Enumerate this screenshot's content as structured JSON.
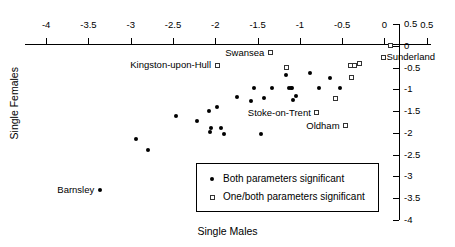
{
  "chart_data": {
    "type": "scatter",
    "title": "",
    "xlabel": "Single Males",
    "ylabel": "Single Females",
    "xlim": [
      -4.25,
      0.55
    ],
    "ylim": [
      -4.0,
      0.5
    ],
    "grid": false,
    "legend_position": "bottom-center",
    "xticks": [
      {
        "value": -4,
        "label": "-4"
      },
      {
        "value": -3.5,
        "label": "-3.5"
      },
      {
        "value": -3,
        "label": "-3"
      },
      {
        "value": -2.5,
        "label": "-2.5"
      },
      {
        "value": -2,
        "label": "-2"
      },
      {
        "value": -1.5,
        "label": "-1.5"
      },
      {
        "value": -1,
        "label": "-1"
      },
      {
        "value": -0.5,
        "label": "-0.5"
      },
      {
        "value": 0,
        "label": "0"
      },
      {
        "value": 0.5,
        "label": "0.5"
      }
    ],
    "yticks": [
      {
        "value": 0.5,
        "label": "0.5"
      },
      {
        "value": 0,
        "label": "0"
      },
      {
        "value": -0.5,
        "label": "-0.5"
      },
      {
        "value": -1,
        "label": "-1"
      },
      {
        "value": -1.5,
        "label": "-1.5"
      },
      {
        "value": -2,
        "label": "-2"
      },
      {
        "value": -2.5,
        "label": "-2.5"
      },
      {
        "value": -3,
        "label": "-3"
      },
      {
        "value": -3.5,
        "label": "-3.5"
      },
      {
        "value": -4,
        "label": "-4"
      }
    ],
    "legend": [
      {
        "marker": "filled-circle",
        "label": "Both parameters significant"
      },
      {
        "marker": "open-square",
        "label": "One/both parameters significant"
      }
    ],
    "series": [
      {
        "name": "Both parameters significant",
        "marker": "filled-circle",
        "points": [
          {
            "x": -3.36,
            "y": -3.32,
            "label": "Barnsley",
            "label_side": "right"
          },
          {
            "x": -2.94,
            "y": -2.15
          },
          {
            "x": -2.8,
            "y": -2.4
          },
          {
            "x": -2.47,
            "y": -1.62
          },
          {
            "x": -2.22,
            "y": -1.72
          },
          {
            "x": -2.08,
            "y": -1.5
          },
          {
            "x": -2.05,
            "y": -1.88
          },
          {
            "x": -2.06,
            "y": -1.98
          },
          {
            "x": -1.98,
            "y": -1.4
          },
          {
            "x": -1.93,
            "y": -1.88
          },
          {
            "x": -1.9,
            "y": -2.02
          },
          {
            "x": -1.74,
            "y": -1.17
          },
          {
            "x": -1.58,
            "y": -1.27
          },
          {
            "x": -1.54,
            "y": -0.96
          },
          {
            "x": -1.46,
            "y": -2.02
          },
          {
            "x": -1.42,
            "y": -1.2
          },
          {
            "x": -1.33,
            "y": -0.98
          },
          {
            "x": -1.16,
            "y": -0.66
          },
          {
            "x": -1.13,
            "y": -0.97
          },
          {
            "x": -1.11,
            "y": -0.97
          },
          {
            "x": -1.09,
            "y": -0.98
          },
          {
            "x": -1.08,
            "y": -1.24
          },
          {
            "x": -1.05,
            "y": -1.16
          },
          {
            "x": -1.17,
            "y": -0.49
          },
          {
            "x": -0.88,
            "y": -0.63
          },
          {
            "x": -0.77,
            "y": -0.97
          },
          {
            "x": -0.64,
            "y": -0.75
          },
          {
            "x": -0.52,
            "y": -0.96
          }
        ]
      },
      {
        "name": "One/both parameters significant",
        "marker": "open-square",
        "points": [
          {
            "x": -1.35,
            "y": -0.16,
            "label": "Swansea",
            "label_side": "right"
          },
          {
            "x": -1.98,
            "y": -0.45,
            "label": "Kingston-upon-Hull",
            "label_side": "right"
          },
          {
            "x": -0.8,
            "y": -1.54,
            "label": "Stoke-on-Trent",
            "label_side": "right"
          },
          {
            "x": -0.46,
            "y": -1.84,
            "label": "Oldham",
            "label_side": "right"
          },
          {
            "x": 0.07,
            "y": 0.0,
            "label": "Sunderland",
            "label_side": "below"
          },
          {
            "x": -1.16,
            "y": -0.49
          },
          {
            "x": -0.4,
            "y": -0.45
          },
          {
            "x": -0.36,
            "y": -0.45
          },
          {
            "x": -0.29,
            "y": -0.4
          },
          {
            "x": -0.39,
            "y": -0.72
          },
          {
            "x": -0.58,
            "y": -1.22
          },
          {
            "x": -0.01,
            "y": -0.28
          }
        ]
      }
    ]
  }
}
